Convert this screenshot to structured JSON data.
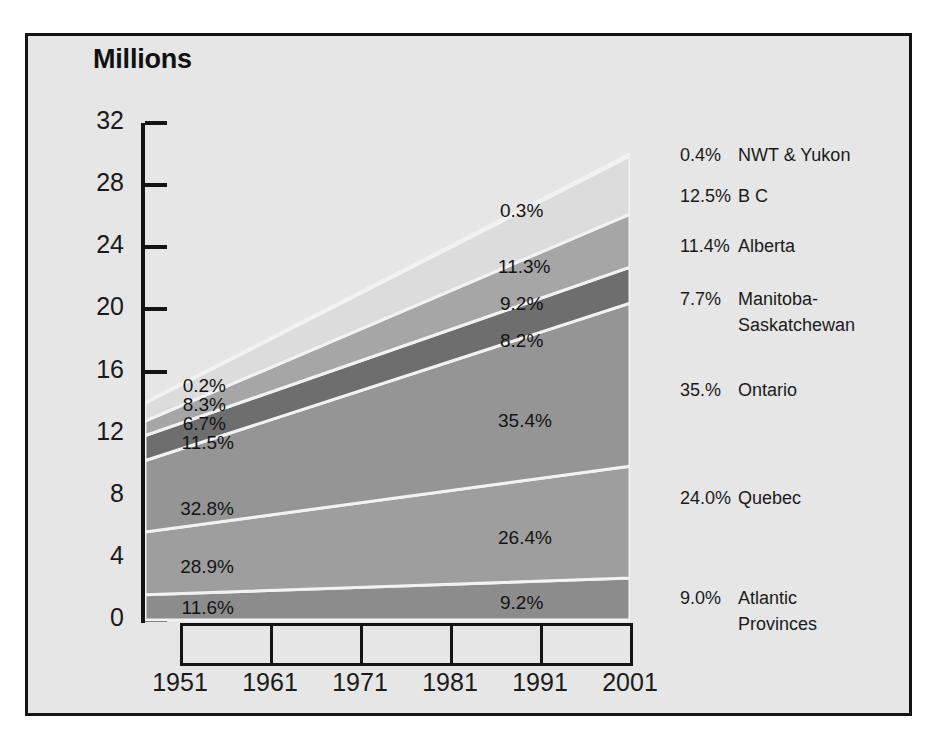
{
  "frame": {
    "background": "#e6e6e6",
    "border_color": "#141414"
  },
  "chart_title": "Millions",
  "axis": {
    "y_ticks": [
      "32",
      "28",
      "24",
      "20",
      "16",
      "12",
      "8",
      "4",
      "0"
    ],
    "x_ticks": [
      "1951",
      "1961",
      "1971",
      "1981",
      "1991",
      "2001"
    ]
  },
  "labels_1951": {
    "nwt_yukon": "0.2%",
    "bc": "8.3%",
    "alberta": "6.7%",
    "manitoba_sask": "11.5%",
    "ontario": "32.8%",
    "quebec": "28.9%",
    "atlantic": "11.6%"
  },
  "labels_1981": {
    "nwt_yukon": "0.3%",
    "bc": "11.3%",
    "alberta": "9.2%",
    "manitoba_sask": "8.2%",
    "ontario": "35.4%",
    "quebec": "26.4%",
    "atlantic": "9.2%"
  },
  "legend": [
    {
      "pct": "0.4%",
      "name": "NWT  & Yukon",
      "name2": ""
    },
    {
      "pct": "12.5%",
      "name": "B C",
      "name2": ""
    },
    {
      "pct": "11.4%",
      "name": "Alberta",
      "name2": ""
    },
    {
      "pct": "7.7%",
      "name": "Manitoba-",
      "name2": "Saskatchewan"
    },
    {
      "pct": "35.%",
      "name": "Ontario",
      "name2": ""
    },
    {
      "pct": "24.0%",
      "name": "Quebec",
      "name2": ""
    },
    {
      "pct": "9.0%",
      "name": "Atlantic",
      "name2": "Provinces"
    }
  ],
  "chart_data": {
    "type": "area",
    "title": "Millions",
    "xlabel": "",
    "ylabel": "Millions",
    "ylim": [
      0,
      32
    ],
    "grid": false,
    "legend_position": "right",
    "x": [
      1951,
      2001
    ],
    "x_tick_labels": [
      "1951",
      "1961",
      "1971",
      "1981",
      "1991",
      "2001"
    ],
    "stacked": true,
    "note": "Share-of-population percentages shown at 1951 (left), 1981 (mid-plot) and 2001 (right legend). Band values are millions of persons at the two plotted endpoints.",
    "series": [
      {
        "name": "Atlantic Provinces",
        "color": "#8c8c8c",
        "values": [
          1.62,
          2.7
        ],
        "pct_1951": "11.6%",
        "pct_1981": "9.2%",
        "pct_2001": "9.0%"
      },
      {
        "name": "Quebec",
        "color": "#9e9e9e",
        "values": [
          4.05,
          7.2
        ],
        "pct_1951": "28.9%",
        "pct_1981": "26.4%",
        "pct_2001": "24.0%"
      },
      {
        "name": "Ontario",
        "color": "#959595",
        "values": [
          4.59,
          10.5
        ],
        "pct_1951": "32.8%",
        "pct_1981": "35.4%",
        "pct_2001": "35.%"
      },
      {
        "name": "Manitoba-Saskatchewan",
        "color": "#6e6e6e",
        "values": [
          1.61,
          2.31
        ],
        "pct_1951": "11.5%",
        "pct_1981": "8.2%",
        "pct_2001": "7.7%"
      },
      {
        "name": "Alberta",
        "color": "#a6a6a6",
        "values": [
          0.94,
          3.42
        ],
        "pct_1951": "6.7%",
        "pct_1981": "9.2%",
        "pct_2001": "11.4%"
      },
      {
        "name": "B C",
        "color": "#dcdcdc",
        "values": [
          1.16,
          3.75
        ],
        "pct_1951": "8.3%",
        "pct_1981": "11.3%",
        "pct_2001": "12.5%"
      },
      {
        "name": "NWT & Yukon",
        "color": "#767676",
        "values": [
          0.03,
          0.12
        ],
        "pct_1951": "0.2%",
        "pct_1981": "0.3%",
        "pct_2001": "0.4%"
      }
    ],
    "totals": {
      "1951": 14.0,
      "2001": 30.0
    }
  }
}
